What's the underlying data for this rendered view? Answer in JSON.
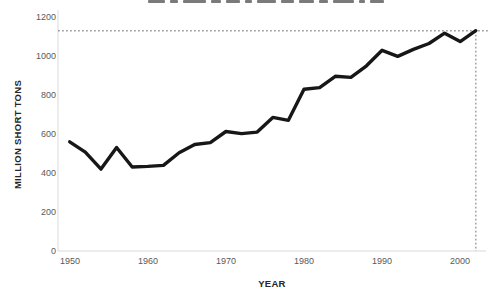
{
  "figure": {
    "title_clipped": true
  },
  "chart_data": {
    "type": "line",
    "title": "",
    "xlabel": "YEAR",
    "ylabel": "MILLION SHORT TONS",
    "xlim": [
      1948.5,
      2003.3
    ],
    "ylim": [
      0,
      1200
    ],
    "xticks": [
      1950,
      1960,
      1970,
      1980,
      1990,
      2000
    ],
    "yticks": [
      0,
      200,
      400,
      600,
      800,
      1000,
      1200
    ],
    "grid": false,
    "legend": "none",
    "line_color": "#171717",
    "series": [
      {
        "name": "coal-production",
        "x": [
          1950,
          1952,
          1954,
          1956,
          1958,
          1960,
          1962,
          1964,
          1966,
          1968,
          1970,
          1972,
          1974,
          1976,
          1978,
          1980,
          1982,
          1984,
          1986,
          1988,
          1990,
          1992,
          1994,
          1996,
          1998,
          2000,
          2002
        ],
        "values": [
          560,
          507,
          420,
          531,
          431,
          434,
          439,
          504,
          546,
          556,
          613,
          602,
          610,
          685,
          670,
          830,
          838,
          896,
          890,
          950,
          1029,
          998,
          1034,
          1064,
          1117,
          1074,
          1130
        ]
      }
    ],
    "reference_lines": {
      "style": "dotted",
      "color": "#9e9e9e",
      "horizontal_y": 1130,
      "vertical_x": 2002
    }
  }
}
